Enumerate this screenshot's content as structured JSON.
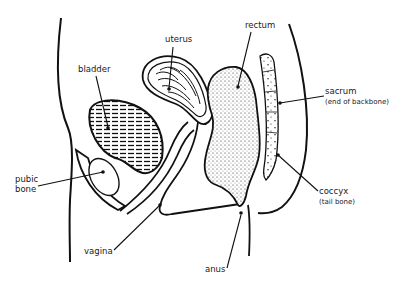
{
  "diagram": {
    "type": "anatomical-cross-section",
    "colors": {
      "ink": "#111111",
      "background": "#ffffff"
    },
    "labels": {
      "uterus": "uterus",
      "bladder": "bladder",
      "rectum": "rectum",
      "sacrum": "sacrum",
      "sacrum_note": "(end of backbone)",
      "pubic_bone_1": "pubic",
      "pubic_bone_2": "bone",
      "coccyx": "coccyx",
      "coccyx_note": "(tail bone)",
      "vagina": "vagina",
      "anus": "anus"
    }
  }
}
